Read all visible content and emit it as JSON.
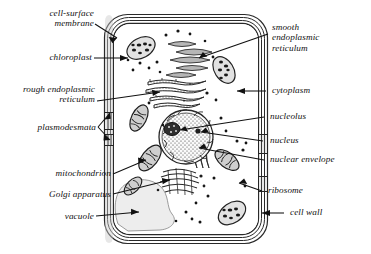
{
  "diagram": {
    "style": "labelled line diagram, italic serif labels with leader lines and arrowheads",
    "ink": "#1a1a1a",
    "fill_light": "#efefef",
    "fill_mid": "#bdbdbd",
    "fill_dark": "#4a4a4a"
  },
  "labels_left": [
    {
      "id": "cell-surface-membrane",
      "text": "cell-surface\nmembrane"
    },
    {
      "id": "chloroplast",
      "text": "chloroplast"
    },
    {
      "id": "rough-endoplasmic-reticulum",
      "text": "rough endoplasmic\nreticulum"
    },
    {
      "id": "plasmodesmata",
      "text": "plasmodesmata"
    },
    {
      "id": "mitochondrion",
      "text": "mitochondrion"
    },
    {
      "id": "golgi-apparatus",
      "text": "Golgi apparatus"
    },
    {
      "id": "vacuole",
      "text": "vacuole"
    }
  ],
  "labels_right": [
    {
      "id": "smooth-endoplasmic-reticulum",
      "text": "smooth\nendoplasmic\nreticulum"
    },
    {
      "id": "cytoplasm",
      "text": "cytoplasm"
    },
    {
      "id": "nucleolus",
      "text": "nucleolus"
    },
    {
      "id": "nucleus",
      "text": "nucleus"
    },
    {
      "id": "nuclear-envelope",
      "text": "nuclear envelope"
    },
    {
      "id": "ribosome",
      "text": "ribosome"
    },
    {
      "id": "cell-wall",
      "text": "cell wall"
    }
  ],
  "structures": [
    {
      "id": "cell-wall",
      "shape": "rounded-rectangle",
      "lines": 4
    },
    {
      "id": "cell-surface-membrane",
      "shape": "inner-rounded-rectangle"
    },
    {
      "id": "nucleus",
      "shape": "stippled-circle-scalloped-envelope"
    },
    {
      "id": "nucleolus",
      "shape": "dark-blob-inside-nucleus"
    },
    {
      "id": "chloroplast",
      "shape": "oval-with-dark-grana",
      "count": 3
    },
    {
      "id": "mitochondrion",
      "shape": "striped-oval",
      "count": 3
    },
    {
      "id": "golgi-apparatus",
      "shape": "stack-of-curved-cisternae"
    },
    {
      "id": "rough-endoplasmic-reticulum",
      "shape": "stacked-dotted-cisternae"
    },
    {
      "id": "smooth-endoplasmic-reticulum",
      "shape": "wavy-tubules"
    },
    {
      "id": "vacuole",
      "shape": "large-pale-irregular-sac"
    },
    {
      "id": "ribosome",
      "shape": "small-dots",
      "count": 26
    },
    {
      "id": "plasmodesmata",
      "shape": "wall-channel",
      "count": 3
    }
  ]
}
